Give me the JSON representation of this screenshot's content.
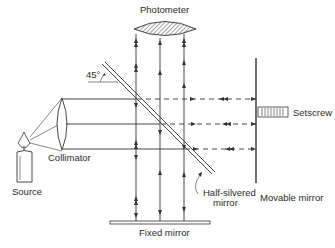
{
  "labels": {
    "photometer": "Photometer",
    "angle": "45°",
    "setscrew": "Setscrew",
    "source": "Source",
    "collimator": "Collimator",
    "movable_mirror": "Movable mirror",
    "half_silvered_mirror_line1": "Half-silvered",
    "half_silvered_mirror_line2": "mirror",
    "fixed_mirror": "Fixed mirror"
  },
  "colors": {
    "line": "#333333",
    "background": "#ffffff",
    "hatch": "#777777"
  }
}
